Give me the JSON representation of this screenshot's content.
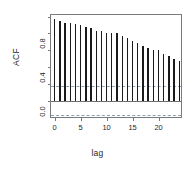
{
  "chart_data": {
    "type": "bar",
    "title": "",
    "subtitle": "",
    "xlabel": "lag",
    "ylabel": "ACF",
    "x": [
      0,
      1,
      2,
      3,
      4,
      5,
      6,
      7,
      8,
      9,
      10,
      11,
      12,
      13,
      14,
      15,
      16,
      17,
      18,
      19,
      20,
      21,
      22,
      23,
      24
    ],
    "values": [
      0.97,
      0.95,
      0.93,
      0.93,
      0.91,
      0.9,
      0.88,
      0.86,
      0.83,
      0.83,
      0.81,
      0.8,
      0.8,
      0.77,
      0.74,
      0.71,
      0.69,
      0.65,
      0.63,
      0.6,
      0.6,
      0.56,
      0.53,
      0.49,
      0.47
    ],
    "series": [
      {
        "name": "ACF",
        "values": [
          0.97,
          0.95,
          0.93,
          0.93,
          0.91,
          0.9,
          0.88,
          0.86,
          0.83,
          0.83,
          0.81,
          0.8,
          0.8,
          0.77,
          0.74,
          0.71,
          0.69,
          0.65,
          0.63,
          0.6,
          0.6,
          0.56,
          0.53,
          0.49,
          0.47
        ]
      }
    ],
    "xlim": [
      -0.7,
      24.7
    ],
    "ylim": [
      -0.22,
      1.02
    ],
    "xticks": [
      0,
      5,
      10,
      15,
      20
    ],
    "xtick_labels": [
      "0",
      "5",
      "10",
      "15",
      "20"
    ],
    "yticks": [
      0.0,
      0.2,
      0.4,
      0.6,
      0.8,
      1.0
    ],
    "ytick_labels": [
      "0.0",
      "",
      "0.4",
      "",
      "0.8",
      ""
    ],
    "ytick_labels_shown": [
      "0.0",
      "0.4",
      "0.8"
    ],
    "grid": false,
    "legend": null,
    "legend_position": "none",
    "zero_line": 0.0,
    "confidence_bounds": [
      0.17,
      -0.17
    ],
    "confidence_level": 0.95,
    "annotations": [],
    "colors": {
      "bar": "#1a1a1a",
      "zero_line": "#6f6f6f",
      "confidence_line": "#8e9fb5",
      "frame": "#7a7a7a",
      "background": "#ffffff",
      "text": "#1f1f1f"
    }
  }
}
